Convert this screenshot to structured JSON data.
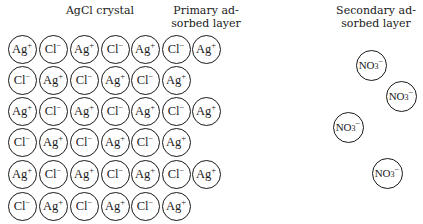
{
  "labels": {
    "crystal": "AgCl crystal",
    "primary_line1": "Primary ad-",
    "primary_line2": "sorbed layer",
    "secondary_line1": "Secondary ad-",
    "secondary_line2": "sorbed layer"
  },
  "crystal_rows": [
    [
      "Ag+",
      "Cl-",
      "Ag+",
      "Cl-",
      "Ag+",
      "Cl-"
    ],
    [
      "Cl-",
      "Ag+",
      "Cl-",
      "Ag+",
      "Cl-",
      "Ag+"
    ],
    [
      "Ag+",
      "Cl-",
      "Ag+",
      "Cl-",
      "Ag+",
      "Cl-"
    ],
    [
      "Cl-",
      "Ag+",
      "Cl-",
      "Ag+",
      "Cl-",
      "Ag+"
    ],
    [
      "Ag+",
      "Cl-",
      "Ag+",
      "Cl-",
      "Ag+",
      "Cl-"
    ],
    [
      "Cl-",
      "Ag+",
      "Cl-",
      "Ag+",
      "Cl-",
      "Ag+"
    ]
  ],
  "primary_layer": [
    {
      "row": 0,
      "ion": "Ag+"
    },
    {
      "row": 2,
      "ion": "Ag+"
    },
    {
      "row": 4,
      "ion": "Ag+"
    }
  ],
  "secondary_layer": [
    {
      "ion": "NO3-",
      "cx": 371,
      "cy": 65
    },
    {
      "ion": "NO3-",
      "cx": 401,
      "cy": 96
    },
    {
      "ion": "NO3-",
      "cx": 348,
      "cy": 127
    },
    {
      "ion": "NO3-",
      "cx": 387,
      "cy": 173
    }
  ],
  "ion_parts": {
    "Ag+": {
      "base": "Ag",
      "sub": "",
      "sup": "+"
    },
    "Cl-": {
      "base": "Cl",
      "sub": "",
      "sup": "−"
    },
    "NO3-": {
      "base": "NO",
      "sub": "3",
      "sup": "−"
    }
  }
}
